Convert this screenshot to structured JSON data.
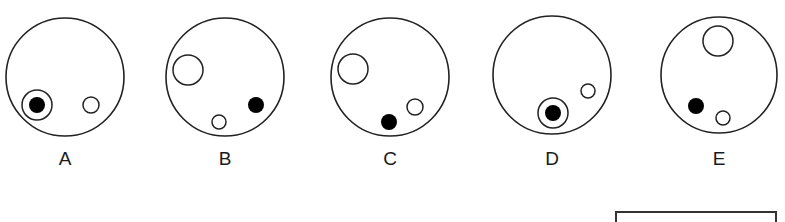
{
  "figure": {
    "stroke_color": "#222222",
    "fill_color": "#000000",
    "options": [
      {
        "label": "A",
        "outer": {
          "cx": 65,
          "cy": 77,
          "r": 59
        },
        "shapes": [
          {
            "type": "ring",
            "cx": 37,
            "cy": 105,
            "r": 15
          },
          {
            "type": "dot",
            "cx": 37,
            "cy": 105,
            "r": 8
          },
          {
            "type": "open",
            "cx": 91,
            "cy": 105,
            "r": 8
          }
        ]
      },
      {
        "label": "B",
        "outer": {
          "cx": 225,
          "cy": 77,
          "r": 59
        },
        "shapes": [
          {
            "type": "open",
            "cx": 188,
            "cy": 70,
            "r": 15
          },
          {
            "type": "open",
            "cx": 219,
            "cy": 122,
            "r": 7
          },
          {
            "type": "dot",
            "cx": 256,
            "cy": 105,
            "r": 8
          }
        ]
      },
      {
        "label": "C",
        "outer": {
          "cx": 390,
          "cy": 77,
          "r": 59
        },
        "shapes": [
          {
            "type": "open",
            "cx": 353,
            "cy": 69,
            "r": 15
          },
          {
            "type": "open",
            "cx": 415,
            "cy": 107,
            "r": 8
          },
          {
            "type": "dot",
            "cx": 389,
            "cy": 122,
            "r": 8
          }
        ]
      },
      {
        "label": "D",
        "outer": {
          "cx": 552,
          "cy": 75,
          "r": 59
        },
        "shapes": [
          {
            "type": "open",
            "cx": 588,
            "cy": 91,
            "r": 7
          },
          {
            "type": "ring",
            "cx": 553,
            "cy": 113,
            "r": 15
          },
          {
            "type": "dot",
            "cx": 553,
            "cy": 113,
            "r": 8
          }
        ]
      },
      {
        "label": "E",
        "outer": {
          "cx": 719,
          "cy": 75,
          "r": 58
        },
        "shapes": [
          {
            "type": "open",
            "cx": 718,
            "cy": 41,
            "r": 15
          },
          {
            "type": "dot",
            "cx": 696,
            "cy": 106,
            "r": 8
          },
          {
            "type": "open",
            "cx": 723,
            "cy": 118,
            "r": 7
          }
        ]
      }
    ]
  }
}
